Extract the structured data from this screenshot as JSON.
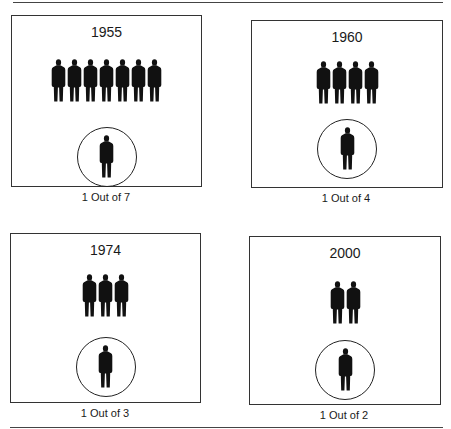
{
  "panels": [
    {
      "year": "1955",
      "group_count": 7,
      "caption": "1 Out of 7"
    },
    {
      "year": "1960",
      "group_count": 4,
      "caption": "1 Out of 4"
    },
    {
      "year": "1974",
      "group_count": 3,
      "caption": "1 Out of 3"
    },
    {
      "year": "2000",
      "group_count": 2,
      "caption": "1 Out of 2"
    }
  ],
  "icons": {
    "person": "person-silhouette-icon",
    "highlight": "circle-outline"
  },
  "colors": {
    "figure": "#111111",
    "border": "#333333",
    "background": "#ffffff"
  }
}
